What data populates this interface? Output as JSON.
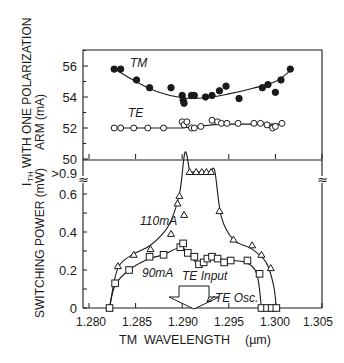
{
  "chart_data": [
    {
      "type": "scatter",
      "panel": "top",
      "title": "",
      "xlabel": "TM WAVELENGTH (µm)",
      "ylabel": "I_TH WITH ONE POLARIZATION ARM (mA)",
      "ylabel_line1": "I",
      "ylabel_sub": "TH",
      "ylabel_line1_rest": " WITH ONE POLARIZATION",
      "ylabel_line2": "ARM (mA)",
      "xlim": [
        1.28,
        1.305
      ],
      "ylim": [
        50,
        57
      ],
      "yticks": [
        50,
        52,
        54,
        56
      ],
      "ytick_labels": [
        "50",
        "52",
        "54",
        "56"
      ],
      "grid": false,
      "series": [
        {
          "name": "TM",
          "label": "TM",
          "marker": "filled-circle",
          "fit": "smooth curve",
          "x": [
            1.2827,
            1.2834,
            1.2851,
            1.2865,
            1.2888,
            1.29,
            1.2901,
            1.2902,
            1.291,
            1.2913,
            1.2925,
            1.2932,
            1.294,
            1.2947,
            1.2961,
            1.2986,
            1.2992,
            1.3,
            1.3006,
            1.3016
          ],
          "y": [
            55.8,
            55.8,
            55.1,
            54.6,
            54.6,
            54.1,
            53.8,
            53.6,
            54.1,
            54.1,
            54.0,
            54.1,
            54.4,
            54.7,
            53.9,
            54.6,
            54.8,
            54.3,
            55.1,
            55.8
          ]
        },
        {
          "name": "TE",
          "label": "TE",
          "marker": "open-circle",
          "fit": "connected line",
          "x": [
            1.2827,
            1.2834,
            1.2848,
            1.2863,
            1.288,
            1.29,
            1.2902,
            1.2905,
            1.291,
            1.2913,
            1.292,
            1.2932,
            1.2938,
            1.2942,
            1.2948,
            1.296,
            1.2977,
            1.2984,
            1.2991,
            1.2997,
            1.3,
            1.3007
          ],
          "y": [
            52.0,
            52.0,
            52.0,
            52.0,
            52.0,
            52.4,
            52.2,
            52.4,
            52.0,
            52.0,
            52.1,
            52.5,
            52.4,
            52.3,
            52.3,
            52.3,
            52.3,
            52.3,
            52.2,
            52.0,
            52.1,
            52.3
          ]
        }
      ]
    },
    {
      "type": "line",
      "panel": "bottom",
      "title": "",
      "xlabel": "TM WAVELENGTH (µm)",
      "ylabel": "SWITCHING POWER (mW)",
      "xlim": [
        1.28,
        1.305
      ],
      "ylim": [
        0,
        0.95
      ],
      "xticks": [
        1.28,
        1.285,
        1.29,
        1.295,
        1.3,
        1.305
      ],
      "xtick_labels": [
        "1.280",
        "1.285",
        "1.290",
        "1.295",
        "1.300",
        "1.305"
      ],
      "yticks": [
        0,
        0.2,
        0.4,
        0.6
      ],
      "ytick_labels": [
        "0",
        "0.2",
        "0.4",
        "0.6"
      ],
      "ytick_extra_label": ">0.9",
      "axis_break": "≈",
      "grid": false,
      "series": [
        {
          "name": "110mA",
          "label": "110mA",
          "marker": "open-triangle",
          "x": [
            1.2822,
            1.2831,
            1.2848,
            1.2866,
            1.2888,
            1.2895,
            1.2897,
            1.2902,
            1.2908,
            1.2915,
            1.2921,
            1.2926,
            1.2931,
            1.294,
            1.2955,
            1.2975,
            1.2985,
            1.2995,
            1.3001
          ],
          "y": [
            0.0,
            0.22,
            0.28,
            0.31,
            0.39,
            0.55,
            0.59,
            0.49,
            0.92,
            0.92,
            0.92,
            0.92,
            0.92,
            0.51,
            0.36,
            0.33,
            0.28,
            0.21,
            0.0
          ],
          "saturated_note": ">0.9 plateau from ~1.2908 to ~1.2931"
        },
        {
          "name": "90mA",
          "label": "90mA",
          "marker": "open-square",
          "x": [
            1.2822,
            1.2828,
            1.2843,
            1.2865,
            1.288,
            1.2898,
            1.2901,
            1.2906,
            1.2913,
            1.2918,
            1.2923,
            1.2927,
            1.2932,
            1.2938,
            1.2945,
            1.2952,
            1.297,
            1.2983,
            1.2985,
            1.2991,
            1.2996,
            1.3001
          ],
          "y": [
            0.0,
            0.13,
            0.2,
            0.27,
            0.28,
            0.32,
            0.34,
            0.29,
            0.27,
            0.23,
            0.24,
            0.26,
            0.27,
            0.26,
            0.24,
            0.25,
            0.25,
            0.18,
            0.0,
            0.0,
            0.0,
            0.0
          ]
        }
      ],
      "annotations": [
        {
          "text": "110mA",
          "x": 1.2847,
          "y": 0.49
        },
        {
          "text": "90mA",
          "x": 1.2852,
          "y": 0.16
        },
        {
          "text": "TE Input",
          "x": 1.2897,
          "y": 0.11,
          "arrow": "down-pointing block arrow at ~1.291 µm"
        },
        {
          "text": "TE Osc.",
          "x": 1.293,
          "y": 0.02,
          "arrow": "small arrow pointing left to block arrow"
        }
      ]
    }
  ],
  "labels": {
    "top_ylabel_main": "WITH ONE POLARIZATION",
    "top_ylabel_I": "I",
    "top_ylabel_sub": "TH",
    "top_ylabel_line2": "ARM (mA)",
    "bottom_ylabel": "SWITCHING POWER (mW)",
    "xlabel_main": "TM  WAVELENGTH",
    "xlabel_unit": "(µm)",
    "tm_label": "TM",
    "te_label": "TE",
    "label_110": "110mA",
    "label_90": "90mA",
    "te_input": "TE Input",
    "te_osc": "TE Osc.",
    "break_symbol": "≈",
    "gt09": ">0.9",
    "top_yticks": [
      "56",
      "54",
      "52",
      "50"
    ],
    "bottom_yticks": [
      "0.6",
      "0.4",
      "0.2",
      "0"
    ],
    "xticks": [
      "1.280",
      "1.285",
      "1.290",
      "1.295",
      "1.300",
      "1.305"
    ]
  },
  "colors": {
    "ink": "#1a1a1a",
    "background": "#ffffff"
  }
}
